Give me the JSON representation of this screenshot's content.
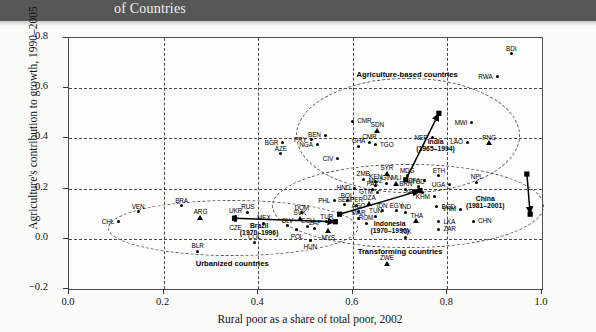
{
  "banner": {
    "title": "of Countries"
  },
  "chart_data": {
    "type": "scatter",
    "title": "",
    "xlabel": "Rural poor as a share of total poor, 2002",
    "ylabel": "Agriculture's contribution to growth, 1990–2005",
    "xlim": [
      0.0,
      1.0
    ],
    "ylim": [
      -0.2,
      0.8
    ],
    "xticks": [
      "0.0",
      "0.2",
      "0.4",
      "0.6",
      "0.8",
      "1.0"
    ],
    "yticks": [
      "−0.2",
      "0.0",
      "0.2",
      "0.4",
      "0.6",
      "0.8"
    ],
    "grid": "dashed",
    "legend": "none",
    "zones": [
      {
        "name": "agriculture-based",
        "label": "Agriculture-based countries"
      },
      {
        "name": "transforming",
        "label": "Transforming countries"
      },
      {
        "name": "urbanized",
        "label": "Urbanized countries"
      }
    ],
    "trajectories": [
      {
        "name": "brazil",
        "label": "Brazil",
        "period": "(1970–1996)",
        "from": [
          0.35,
          0.082
        ],
        "to": [
          0.563,
          0.068
        ]
      },
      {
        "name": "india",
        "label": "India",
        "period": "(1965–1994)",
        "from": [
          0.712,
          0.235
        ],
        "to": [
          0.782,
          0.5
        ]
      },
      {
        "name": "indonesia",
        "label": "Indonesia",
        "period": "(1970–1996)",
        "from": [
          0.572,
          0.098
        ],
        "to": [
          0.742,
          0.192
        ]
      },
      {
        "name": "china",
        "label": "China",
        "period": "(1981–2001)",
        "from": [
          0.968,
          0.258
        ],
        "to": [
          0.975,
          0.098
        ]
      }
    ],
    "points": [
      {
        "code": "CHL",
        "x": 0.105,
        "y": 0.068,
        "marker": "circle",
        "lpos": "left"
      },
      {
        "code": "VEN",
        "x": 0.146,
        "y": 0.108,
        "marker": "circle",
        "lpos": "above"
      },
      {
        "code": "BRA",
        "x": 0.238,
        "y": 0.131,
        "marker": "circle",
        "lpos": "above"
      },
      {
        "code": "ARG",
        "x": 0.278,
        "y": 0.085,
        "marker": "triangle",
        "lpos": "above"
      },
      {
        "code": "BLR",
        "x": 0.272,
        "y": -0.05,
        "marker": "circle",
        "lpos": "above"
      },
      {
        "code": "UKR",
        "x": 0.352,
        "y": 0.09,
        "marker": "circle",
        "lpos": "above"
      },
      {
        "code": "RUS",
        "x": 0.378,
        "y": 0.105,
        "marker": "circle",
        "lpos": "above"
      },
      {
        "code": "CZE",
        "x": 0.352,
        "y": 0.072,
        "marker": "circle",
        "lpos": "below"
      },
      {
        "code": "COL",
        "x": 0.392,
        "y": -0.014,
        "marker": "circle",
        "lpos": "above"
      },
      {
        "code": "MEX",
        "x": 0.412,
        "y": 0.062,
        "marker": "circle",
        "lpos": "above"
      },
      {
        "code": "SVK",
        "x": 0.488,
        "y": 0.082,
        "marker": "triangle",
        "lpos": "above"
      },
      {
        "code": "DOM",
        "x": 0.492,
        "y": 0.103,
        "marker": "circle",
        "lpos": "above"
      },
      {
        "code": "SLV",
        "x": 0.462,
        "y": 0.052,
        "marker": "circle",
        "lpos": "above"
      },
      {
        "code": "POL",
        "x": 0.482,
        "y": 0.036,
        "marker": "circle",
        "lpos": "below"
      },
      {
        "code": "ECU",
        "x": 0.505,
        "y": 0.05,
        "marker": "circle",
        "lpos": "above"
      },
      {
        "code": "ZAF",
        "x": 0.52,
        "y": 0.042,
        "marker": "circle",
        "lpos": "above"
      },
      {
        "code": "HUN",
        "x": 0.51,
        "y": -0.006,
        "marker": "circle",
        "lpos": "below"
      },
      {
        "code": "MYS",
        "x": 0.548,
        "y": 0.032,
        "marker": "triangle",
        "lpos": "below"
      },
      {
        "code": "TUR",
        "x": 0.545,
        "y": 0.068,
        "marker": "circle",
        "lpos": "above"
      },
      {
        "code": "PHL",
        "x": 0.562,
        "y": 0.152,
        "marker": "circle",
        "lpos": "left"
      },
      {
        "code": "BOL",
        "x": 0.588,
        "y": 0.152,
        "marker": "circle",
        "lpos": "above"
      },
      {
        "code": "PER",
        "x": 0.608,
        "y": 0.133,
        "marker": "circle",
        "lpos": "above"
      },
      {
        "code": "SEN",
        "x": 0.582,
        "y": 0.135,
        "marker": "circle",
        "lpos": "above"
      },
      {
        "code": "AGO",
        "x": 0.612,
        "y": 0.11,
        "marker": "circle",
        "lpos": "above"
      },
      {
        "code": "MAR",
        "x": 0.612,
        "y": 0.082,
        "marker": "circle",
        "lpos": "above"
      },
      {
        "code": "ROM",
        "x": 0.628,
        "y": 0.062,
        "marker": "circle",
        "lpos": "above"
      },
      {
        "code": "DZA",
        "x": 0.635,
        "y": 0.142,
        "marker": "triangle",
        "lpos": "above"
      },
      {
        "code": "TUN",
        "x": 0.648,
        "y": 0.09,
        "marker": "circle",
        "lpos": "above"
      },
      {
        "code": "IDN",
        "x": 0.662,
        "y": 0.112,
        "marker": "circle",
        "lpos": "above"
      },
      {
        "code": "EGY",
        "x": 0.692,
        "y": 0.112,
        "marker": "circle",
        "lpos": "above"
      },
      {
        "code": "GTM",
        "x": 0.652,
        "y": 0.185,
        "marker": "circle",
        "lpos": "left"
      },
      {
        "code": "HND",
        "x": 0.604,
        "y": 0.202,
        "marker": "circle",
        "lpos": "left"
      },
      {
        "code": "PAK",
        "x": 0.642,
        "y": 0.198,
        "marker": "circle",
        "lpos": "above"
      },
      {
        "code": "ZMB",
        "x": 0.622,
        "y": 0.238,
        "marker": "circle",
        "lpos": "above"
      },
      {
        "code": "KEN",
        "x": 0.648,
        "y": 0.228,
        "marker": "circle",
        "lpos": "above"
      },
      {
        "code": "MOZ",
        "x": 0.648,
        "y": 0.212,
        "marker": "circle",
        "lpos": "above"
      },
      {
        "code": "GIN",
        "x": 0.672,
        "y": 0.222,
        "marker": "circle",
        "lpos": "above"
      },
      {
        "code": "MLI",
        "x": 0.692,
        "y": 0.222,
        "marker": "triangle",
        "lpos": "above"
      },
      {
        "code": "SYR",
        "x": 0.672,
        "y": 0.262,
        "marker": "triangle",
        "lpos": "above"
      },
      {
        "code": "MDG",
        "x": 0.715,
        "y": 0.252,
        "marker": "circle",
        "lpos": "above"
      },
      {
        "code": "BRN",
        "x": 0.712,
        "y": 0.198,
        "marker": "circle",
        "lpos": "above"
      },
      {
        "code": "TCD",
        "x": 0.738,
        "y": 0.208,
        "marker": "circle",
        "lpos": "above"
      },
      {
        "code": "YEM",
        "x": 0.748,
        "y": 0.185,
        "marker": "circle",
        "lpos": "left"
      },
      {
        "code": "KHM",
        "x": 0.772,
        "y": 0.168,
        "marker": "circle",
        "lpos": "left"
      },
      {
        "code": "BFA",
        "x": 0.752,
        "y": 0.232,
        "marker": "circle",
        "lpos": "left"
      },
      {
        "code": "ETH",
        "x": 0.782,
        "y": 0.252,
        "marker": "circle",
        "lpos": "above"
      },
      {
        "code": "UGA",
        "x": 0.805,
        "y": 0.215,
        "marker": "circle",
        "lpos": "left"
      },
      {
        "code": "NPL",
        "x": 0.862,
        "y": 0.225,
        "marker": "circle",
        "lpos": "above"
      },
      {
        "code": "LAO",
        "x": 0.842,
        "y": 0.385,
        "marker": "circle",
        "lpos": "left"
      },
      {
        "code": "PNG",
        "x": 0.888,
        "y": 0.382,
        "marker": "triangle",
        "lpos": "above"
      },
      {
        "code": "NER",
        "x": 0.768,
        "y": 0.402,
        "marker": "circle",
        "lpos": "left"
      },
      {
        "code": "MWI",
        "x": 0.852,
        "y": 0.462,
        "marker": "circle",
        "lpos": "left"
      },
      {
        "code": "RWA",
        "x": 0.905,
        "y": 0.645,
        "marker": "circle",
        "lpos": "left"
      },
      {
        "code": "BDI",
        "x": 0.935,
        "y": 0.738,
        "marker": "circle",
        "lpos": "above"
      },
      {
        "code": "CMR",
        "x": 0.6,
        "y": 0.468,
        "marker": "circle",
        "lpos": "right"
      },
      {
        "code": "SDN",
        "x": 0.652,
        "y": 0.432,
        "marker": "triangle",
        "lpos": "above"
      },
      {
        "code": "CMR",
        "x": 0.635,
        "y": 0.385,
        "marker": "circle",
        "lpos": "above"
      },
      {
        "code": "TGO",
        "x": 0.648,
        "y": 0.375,
        "marker": "circle",
        "lpos": "right"
      },
      {
        "code": "GHA",
        "x": 0.612,
        "y": 0.368,
        "marker": "circle",
        "lpos": "above"
      },
      {
        "code": "BEN",
        "x": 0.542,
        "y": 0.412,
        "marker": "circle",
        "lpos": "left"
      },
      {
        "code": "PRY",
        "x": 0.512,
        "y": 0.395,
        "marker": "circle",
        "lpos": "left"
      },
      {
        "code": "NGA",
        "x": 0.525,
        "y": 0.375,
        "marker": "circle",
        "lpos": "left"
      },
      {
        "code": "CIV",
        "x": 0.568,
        "y": 0.318,
        "marker": "circle",
        "lpos": "left"
      },
      {
        "code": "BGR",
        "x": 0.452,
        "y": 0.382,
        "marker": "circle",
        "lpos": "left"
      },
      {
        "code": "AZE",
        "x": 0.448,
        "y": 0.338,
        "marker": "circle",
        "lpos": "above"
      },
      {
        "code": "BGD",
        "x": 0.778,
        "y": 0.128,
        "marker": "circle",
        "lpos": "right"
      },
      {
        "code": "IND",
        "x": 0.712,
        "y": 0.105,
        "marker": "circle",
        "lpos": "above"
      },
      {
        "code": "THA",
        "x": 0.735,
        "y": 0.072,
        "marker": "triangle",
        "lpos": "above"
      },
      {
        "code": "VNM",
        "x": 0.828,
        "y": 0.118,
        "marker": "circle",
        "lpos": "left"
      },
      {
        "code": "CHN",
        "x": 0.855,
        "y": 0.07,
        "marker": "circle",
        "lpos": "right"
      },
      {
        "code": "LKA",
        "x": 0.782,
        "y": 0.068,
        "marker": "circle",
        "lpos": "right"
      },
      {
        "code": "ZAR",
        "x": 0.782,
        "y": 0.038,
        "marker": "circle",
        "lpos": "right"
      },
      {
        "code": "TJK",
        "x": 0.712,
        "y": 0.006,
        "marker": "circle",
        "lpos": "above"
      },
      {
        "code": "ZWE",
        "x": 0.672,
        "y": -0.098,
        "marker": "triangle",
        "lpos": "above"
      }
    ]
  }
}
